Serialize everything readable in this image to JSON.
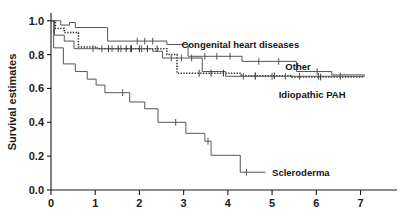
{
  "chart_data": {
    "type": "line",
    "subtype": "kaplan-meier-survival",
    "title": "",
    "xlabel": "",
    "ylabel": "Survival estimates",
    "xlim": [
      0,
      7.35
    ],
    "ylim": [
      0,
      1.04
    ],
    "xticks": [
      "0",
      "1",
      "2",
      "3",
      "4",
      "5",
      "6",
      "7"
    ],
    "xtick_values": [
      0,
      1,
      2,
      3,
      4,
      5,
      6,
      7
    ],
    "yticks": [
      "0.0",
      "0.2",
      "0.4",
      "0.6",
      "0.8",
      "1.0"
    ],
    "ytick_values": [
      0.0,
      0.2,
      0.4,
      0.6,
      0.8,
      1.0
    ],
    "grid": false,
    "legend_position": "inline-right-of-curves",
    "series": [
      {
        "name": "Congenital heart diseases",
        "label": "Congenital heart diseases",
        "style": "dotted",
        "color": "#333333",
        "label_x": 2.95,
        "label_y": 0.865,
        "points": [
          [
            0.0,
            1.0
          ],
          [
            0.1,
            1.0
          ],
          [
            0.1,
            0.955
          ],
          [
            0.3,
            0.955
          ],
          [
            0.3,
            0.93
          ],
          [
            0.62,
            0.93
          ],
          [
            0.62,
            0.845
          ],
          [
            1.05,
            0.845
          ],
          [
            1.05,
            0.835
          ],
          [
            2.62,
            0.835
          ],
          [
            2.62,
            0.8
          ],
          [
            2.85,
            0.8
          ],
          [
            2.85,
            0.69
          ],
          [
            4.3,
            0.69
          ],
          [
            4.3,
            0.675
          ],
          [
            5.45,
            0.675
          ],
          [
            5.45,
            0.668
          ],
          [
            7.05,
            0.668
          ]
        ],
        "censor_marks": [
          [
            1.3,
            0.835
          ],
          [
            1.52,
            0.835
          ],
          [
            1.7,
            0.835
          ],
          [
            1.82,
            0.835
          ],
          [
            2.0,
            0.835
          ],
          [
            2.18,
            0.835
          ],
          [
            2.4,
            0.835
          ],
          [
            3.35,
            0.69
          ],
          [
            3.62,
            0.69
          ],
          [
            3.9,
            0.69
          ],
          [
            4.62,
            0.675
          ],
          [
            5.05,
            0.675
          ],
          [
            6.1,
            0.668
          ]
        ]
      },
      {
        "name": "Other",
        "label": "Other",
        "style": "solid",
        "color": "#555555",
        "label_x": 5.3,
        "label_y": 0.73,
        "points": [
          [
            0.0,
            1.0
          ],
          [
            0.22,
            1.0
          ],
          [
            0.22,
            0.975
          ],
          [
            0.42,
            0.975
          ],
          [
            0.42,
            0.99
          ],
          [
            0.55,
            0.99
          ],
          [
            0.55,
            0.96
          ],
          [
            1.28,
            0.96
          ],
          [
            1.28,
            0.88
          ],
          [
            2.62,
            0.88
          ],
          [
            2.62,
            0.86
          ],
          [
            3.1,
            0.86
          ],
          [
            3.1,
            0.79
          ],
          [
            4.32,
            0.79
          ],
          [
            4.32,
            0.76
          ],
          [
            5.55,
            0.76
          ],
          [
            5.55,
            0.7
          ],
          [
            6.35,
            0.7
          ],
          [
            6.35,
            0.68
          ],
          [
            7.1,
            0.68
          ]
        ],
        "censor_marks": [
          [
            1.95,
            0.88
          ],
          [
            2.12,
            0.88
          ],
          [
            2.3,
            0.88
          ],
          [
            3.48,
            0.79
          ],
          [
            3.75,
            0.79
          ],
          [
            4.05,
            0.79
          ],
          [
            4.7,
            0.76
          ],
          [
            5.15,
            0.76
          ],
          [
            6.02,
            0.7
          ]
        ]
      },
      {
        "name": "Idiopathic PAH",
        "label": "Idiopathic PAH",
        "style": "solid",
        "color": "#555555",
        "label_x": 5.15,
        "label_y": 0.565,
        "points": [
          [
            0.0,
            1.0
          ],
          [
            0.08,
            1.0
          ],
          [
            0.08,
            0.915
          ],
          [
            0.3,
            0.915
          ],
          [
            0.3,
            0.88
          ],
          [
            0.52,
            0.88
          ],
          [
            0.52,
            0.835
          ],
          [
            2.3,
            0.835
          ],
          [
            2.3,
            0.82
          ],
          [
            2.52,
            0.82
          ],
          [
            2.52,
            0.78
          ],
          [
            3.42,
            0.78
          ],
          [
            3.42,
            0.7
          ],
          [
            3.95,
            0.7
          ],
          [
            3.95,
            0.672
          ],
          [
            7.1,
            0.672
          ]
        ],
        "censor_marks": [
          [
            0.95,
            0.835
          ],
          [
            1.15,
            0.835
          ],
          [
            1.38,
            0.835
          ],
          [
            1.58,
            0.835
          ],
          [
            1.8,
            0.835
          ],
          [
            2.05,
            0.835
          ],
          [
            2.72,
            0.78
          ],
          [
            2.95,
            0.78
          ],
          [
            3.18,
            0.78
          ],
          [
            4.35,
            0.672
          ],
          [
            4.62,
            0.672
          ],
          [
            5.0,
            0.672
          ],
          [
            5.3,
            0.672
          ],
          [
            5.62,
            0.672
          ],
          [
            6.05,
            0.672
          ],
          [
            6.55,
            0.672
          ]
        ]
      },
      {
        "name": "Scleroderma",
        "label": "Scleroderma",
        "style": "solid",
        "color": "#555555",
        "label_x": 5.0,
        "label_y": 0.105,
        "points": [
          [
            0.0,
            1.0
          ],
          [
            0.06,
            1.0
          ],
          [
            0.06,
            0.84
          ],
          [
            0.28,
            0.84
          ],
          [
            0.28,
            0.745
          ],
          [
            0.55,
            0.745
          ],
          [
            0.55,
            0.7
          ],
          [
            0.82,
            0.7
          ],
          [
            0.82,
            0.655
          ],
          [
            1.02,
            0.655
          ],
          [
            1.02,
            0.62
          ],
          [
            1.22,
            0.62
          ],
          [
            1.22,
            0.575
          ],
          [
            1.78,
            0.575
          ],
          [
            1.78,
            0.52
          ],
          [
            2.12,
            0.52
          ],
          [
            2.12,
            0.48
          ],
          [
            2.42,
            0.48
          ],
          [
            2.42,
            0.4
          ],
          [
            3.05,
            0.4
          ],
          [
            3.05,
            0.335
          ],
          [
            3.48,
            0.335
          ],
          [
            3.48,
            0.288
          ],
          [
            3.62,
            0.288
          ],
          [
            3.62,
            0.205
          ],
          [
            4.28,
            0.205
          ],
          [
            4.28,
            0.105
          ],
          [
            4.85,
            0.105
          ]
        ],
        "censor_marks": [
          [
            1.62,
            0.575
          ],
          [
            2.82,
            0.4
          ],
          [
            3.55,
            0.288
          ],
          [
            4.42,
            0.105
          ]
        ]
      }
    ]
  },
  "axes": {
    "y_axis_title": "Survival estimates"
  }
}
